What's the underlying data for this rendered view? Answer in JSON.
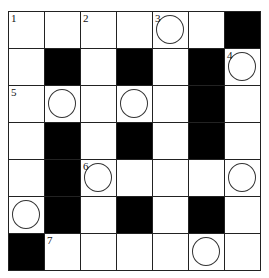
{
  "puzzle": {
    "rows": 7,
    "cols": 7,
    "grid": [
      [
        {
          "n": "1"
        },
        {},
        {
          "n": "2"
        },
        {},
        {
          "n": "3",
          "c": true
        },
        {},
        {
          "b": true
        }
      ],
      [
        {},
        {
          "b": true
        },
        {},
        {
          "b": true
        },
        {},
        {
          "b": true
        },
        {
          "n": "4",
          "c": true
        }
      ],
      [
        {
          "n": "5"
        },
        {
          "c": true
        },
        {},
        {
          "c": true
        },
        {},
        {
          "b": true
        },
        {}
      ],
      [
        {},
        {
          "b": true
        },
        {},
        {
          "b": true
        },
        {},
        {
          "b": true
        },
        {}
      ],
      [
        {},
        {
          "b": true
        },
        {
          "n": "6",
          "c": true
        },
        {},
        {},
        {},
        {
          "c": true
        }
      ],
      [
        {
          "c": true
        },
        {
          "b": true
        },
        {},
        {
          "b": true
        },
        {},
        {
          "b": true
        },
        {}
      ],
      [
        {
          "b": true
        },
        {
          "n": "7"
        },
        {},
        {},
        {},
        {
          "c": true
        },
        {}
      ]
    ]
  }
}
